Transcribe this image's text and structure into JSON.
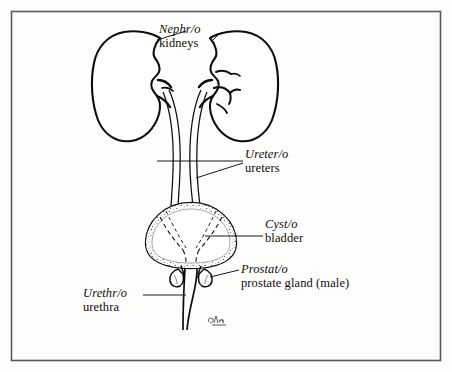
{
  "figure": {
    "background_color": "#fdfdfc",
    "border_color": "#555555",
    "ink_color": "#100d0b"
  },
  "labels": {
    "nephro": {
      "term": "Nephr/o",
      "meaning": "kidneys"
    },
    "uretero": {
      "term": "Ureter/o",
      "meaning": "ureters"
    },
    "cysto": {
      "term": "Cyst/o",
      "meaning": "bladder"
    },
    "prostato": {
      "term": "Prostat/o",
      "meaning": "prostate gland (male)"
    },
    "urethro": {
      "term": "Urethr/o",
      "meaning": "urethra"
    }
  },
  "structures": [
    {
      "name": "left-kidney",
      "label_key": "nephro"
    },
    {
      "name": "right-kidney",
      "label_key": "nephro"
    },
    {
      "name": "left-ureter",
      "label_key": "uretero"
    },
    {
      "name": "right-ureter",
      "label_key": "uretero"
    },
    {
      "name": "bladder",
      "label_key": "cysto"
    },
    {
      "name": "prostate-gland",
      "label_key": "prostato"
    },
    {
      "name": "urethra",
      "label_key": "urethro"
    }
  ],
  "signature": {
    "present": true,
    "text": ""
  }
}
